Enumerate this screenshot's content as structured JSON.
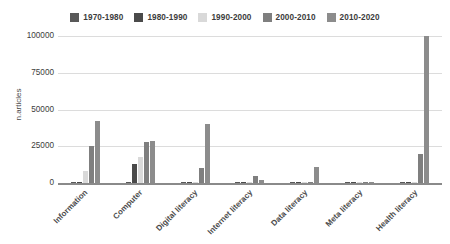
{
  "chart_data": {
    "type": "bar",
    "title": "",
    "xlabel": "",
    "ylabel": "n.articles",
    "ylim": [
      0,
      100000
    ],
    "yticks": [
      0,
      25000,
      50000,
      75000,
      100000
    ],
    "ytick_labels": [
      "0",
      "25000",
      "50000",
      "75000",
      "100000"
    ],
    "grid": true,
    "legend_position": "top-center",
    "categories": [
      "Information",
      "Computer",
      "Digital literacy",
      "Internet literacy",
      "Data literacy",
      "Meta literacy",
      "Health literacy"
    ],
    "series": [
      {
        "name": "1970-1980",
        "color": "#595959",
        "values": [
          300,
          900,
          100,
          60,
          40,
          20,
          150
        ]
      },
      {
        "name": "1980-1990",
        "color": "#4a4a4a",
        "values": [
          500,
          13000,
          200,
          80,
          60,
          30,
          250
        ]
      },
      {
        "name": "1990-2000",
        "color": "#d9d9d9",
        "values": [
          8000,
          17500,
          400,
          150,
          120,
          40,
          400
        ]
      },
      {
        "name": "2000-2010",
        "color": "#7f7f7f",
        "values": [
          25000,
          28000,
          10500,
          4500,
          900,
          200,
          20000
        ]
      },
      {
        "name": "2010-2020",
        "color": "#8c8c8c",
        "values": [
          42000,
          28500,
          40000,
          2000,
          11000,
          600,
          100000
        ]
      }
    ]
  },
  "legend": {
    "items": [
      {
        "label": "1970-1980",
        "color": "#595959"
      },
      {
        "label": "1980-1990",
        "color": "#4a4a4a"
      },
      {
        "label": "1990-2000",
        "color": "#d9d9d9"
      },
      {
        "label": "2000-2010",
        "color": "#7f7f7f"
      },
      {
        "label": "2010-2020",
        "color": "#8c8c8c"
      }
    ]
  },
  "axes": {
    "y_title": "n.articles"
  }
}
